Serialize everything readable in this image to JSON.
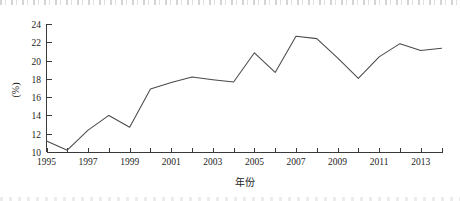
{
  "chart_data": {
    "type": "line",
    "title": "",
    "xlabel": "年份",
    "ylabel": "(%)",
    "xlim": [
      1994.5,
      2014.5
    ],
    "ylim": [
      10,
      24
    ],
    "grid": false,
    "legend": null,
    "x": [
      1995,
      1996,
      1997,
      1998,
      1999,
      2000,
      2001,
      2002,
      2003,
      2004,
      2005,
      2006,
      2007,
      2008,
      2009,
      2010,
      2011,
      2012,
      2013,
      2014
    ],
    "values": [
      11.2,
      10.2,
      12.4,
      14.0,
      12.7,
      16.9,
      17.6,
      18.2,
      17.9,
      17.65,
      20.85,
      18.7,
      22.65,
      22.4,
      20.3,
      18.05,
      20.4,
      21.85,
      21.1,
      21.35
    ],
    "series": [
      {
        "name": "",
        "values": [
          11.2,
          10.2,
          12.4,
          14.0,
          12.7,
          16.9,
          17.6,
          18.2,
          17.9,
          17.65,
          20.85,
          18.7,
          22.65,
          22.4,
          20.3,
          18.05,
          20.4,
          21.85,
          21.1,
          21.35
        ],
        "color": "#4a4a4a"
      }
    ],
    "y_ticks": [
      10,
      12,
      14,
      16,
      18,
      20,
      22,
      24
    ],
    "y_tick_labels": [
      "10",
      "12",
      "14",
      "16",
      "18",
      "20",
      "22",
      "24"
    ],
    "x_ticks": [
      1995,
      1996,
      1997,
      1998,
      1999,
      2000,
      2001,
      2002,
      2003,
      2004,
      2005,
      2006,
      2007,
      2008,
      2009,
      2010,
      2011,
      2012,
      2013,
      2014
    ],
    "x_tick_labels_shown": [
      "1995",
      "1997",
      "1999",
      "2001",
      "2003",
      "2005",
      "2007",
      "2009",
      "2011",
      "2013"
    ],
    "x_tick_labeled_values": [
      1995,
      1997,
      1999,
      2001,
      2003,
      2005,
      2007,
      2009,
      2011,
      2013
    ]
  },
  "colors": {
    "line": "#4a4a4a",
    "axis": "#3a3a3a",
    "text": "#1c1c1c",
    "background": "#ffffff"
  }
}
